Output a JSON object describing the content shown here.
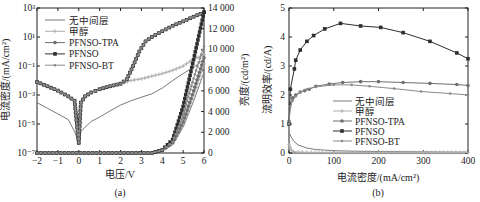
{
  "chart_data": [
    {
      "id": "a",
      "type": "line",
      "caption": "(a)",
      "xlabel": "电压/V",
      "ylabel": "电流密度/(mA/cm²)",
      "ylabel_right": "亮度/(cd/m²)",
      "xlim": [
        -2,
        6
      ],
      "ylim": [
        1e-07,
        1000.0
      ],
      "yscale": "log",
      "ylim_right": [
        0,
        14000
      ],
      "xticks": [
        -2,
        -1,
        0,
        1,
        2,
        3,
        4,
        5,
        6
      ],
      "yticks": [
        "10⁻⁷",
        "10⁻⁵",
        "10⁻³",
        "10⁻¹",
        "10¹",
        "10³"
      ],
      "yticks_right": [
        "0",
        "2 000",
        "4 000",
        "6 000",
        "8 000",
        "10 000",
        "12 000",
        "14 000"
      ],
      "legend": [
        "无中间层",
        "甲醇",
        "PFNSO-TPA",
        "PFNSO",
        "PFNSO-BT"
      ],
      "grid": false,
      "series_current_density": [
        {
          "name": "无中间层",
          "x": [
            -2,
            -1.5,
            -1,
            -0.5,
            -0.2,
            0,
            0.1,
            0.3,
            0.6,
            1,
            1.5,
            2,
            2.5,
            3,
            3.5,
            4,
            4.5,
            5,
            5.5,
            6
          ],
          "y": [
            0.0003,
            0.00012,
            5e-05,
            2e-05,
            3e-06,
            5e-07,
            3e-06,
            6e-06,
            1.5e-05,
            3e-05,
            8e-05,
            0.0002,
            0.0004,
            0.0007,
            0.0012,
            0.003,
            0.01,
            0.03,
            0.08,
            0.3
          ]
        },
        {
          "name": "甲醇",
          "x": [
            -2,
            -1.5,
            -1,
            -0.5,
            -0.2,
            0,
            0.1,
            0.3,
            0.6,
            1,
            1.5,
            2,
            2.5,
            3,
            3.5,
            4,
            4.5,
            5,
            5.5,
            6
          ],
          "y": [
            0.008,
            0.004,
            0.002,
            0.0008,
            0.0004,
            5e-07,
            0.0003,
            0.0008,
            0.0015,
            0.0025,
            0.004,
            0.006,
            0.01,
            0.013,
            0.02,
            0.03,
            0.05,
            0.1,
            0.3,
            0.6
          ]
        },
        {
          "name": "PFNSO-TPA",
          "x": [
            -2,
            -1.5,
            -1,
            -0.5,
            -0.2,
            0,
            0.1,
            0.3,
            0.6,
            1,
            1.5,
            2,
            2.3,
            2.6,
            2.9,
            3.2,
            3.5,
            4,
            4.5,
            5,
            5.5,
            6
          ],
          "y": [
            0.008,
            0.004,
            0.002,
            0.0008,
            0.0004,
            5e-07,
            0.0003,
            0.0008,
            0.0015,
            0.0025,
            0.004,
            0.006,
            0.012,
            0.1,
            1,
            5,
            10,
            25,
            60,
            120,
            250,
            500
          ]
        },
        {
          "name": "PFNSO",
          "x": [
            -2,
            -1.5,
            -1,
            -0.5,
            -0.2,
            0,
            0.1,
            0.3,
            0.6,
            1,
            1.5,
            2,
            2.3,
            2.6,
            2.9,
            3.2,
            3.5,
            4,
            4.5,
            5,
            5.5,
            6
          ],
          "y": [
            0.008,
            0.004,
            0.002,
            0.0008,
            0.0004,
            5e-07,
            0.0003,
            0.0008,
            0.0015,
            0.0025,
            0.004,
            0.006,
            0.012,
            0.1,
            1,
            5,
            10,
            25,
            60,
            120,
            250,
            500
          ]
        },
        {
          "name": "PFNSO-BT",
          "x": [
            -2,
            -1.5,
            -1,
            -0.5,
            -0.2,
            0,
            0.1,
            0.3,
            0.6,
            1,
            1.5,
            2,
            2.3,
            2.6,
            2.9,
            3.2,
            3.5,
            4,
            4.5,
            5,
            5.5,
            6
          ],
          "y": [
            0.008,
            0.004,
            0.002,
            0.0008,
            0.0004,
            5e-07,
            0.0003,
            0.0008,
            0.0015,
            0.0025,
            0.004,
            0.006,
            0.012,
            0.1,
            1,
            5,
            10,
            25,
            60,
            120,
            250,
            500
          ]
        }
      ],
      "series_luminance": [
        {
          "name": "无中间层",
          "x": [
            -2,
            3.5,
            4,
            4.5,
            5,
            5.5,
            6
          ],
          "y": [
            0,
            0,
            200,
            800,
            2500,
            5000,
            7800
          ]
        },
        {
          "name": "甲醇",
          "x": [
            -2,
            3.5,
            4,
            4.5,
            5,
            5.5,
            6
          ],
          "y": [
            0,
            0,
            200,
            900,
            2700,
            5600,
            8600
          ]
        },
        {
          "name": "PFNSO-TPA",
          "x": [
            -2,
            3.5,
            4,
            4.5,
            5,
            5.5,
            6
          ],
          "y": [
            0,
            0,
            250,
            1000,
            3000,
            6000,
            9200
          ]
        },
        {
          "name": "PFNSO",
          "x": [
            -2,
            3.5,
            4,
            4.5,
            5,
            5.5,
            6
          ],
          "y": [
            0,
            0,
            300,
            1300,
            4500,
            9000,
            13600
          ]
        },
        {
          "name": "PFNSO-BT",
          "x": [
            -2,
            3.5,
            4,
            4.5,
            5,
            5.5,
            6
          ],
          "y": [
            0,
            0,
            280,
            1100,
            3600,
            7200,
            10300
          ]
        }
      ]
    },
    {
      "id": "b",
      "type": "line",
      "caption": "(b)",
      "xlabel": "电流密度/(mA/cm²)",
      "ylabel": "流明效率/(cd/A)",
      "xlim": [
        0,
        400
      ],
      "ylim": [
        0,
        5
      ],
      "xticks": [
        0,
        100,
        200,
        300,
        400
      ],
      "yticks": [
        0,
        1,
        2,
        3,
        4,
        5
      ],
      "legend": [
        "无中间层",
        "甲醇",
        "PFNSO-TPA",
        "PFNSO",
        "PFNSO-BT"
      ],
      "grid": false,
      "series": [
        {
          "name": "无中间层",
          "x": [
            0,
            5,
            10,
            20,
            40,
            60,
            100,
            150,
            200,
            300,
            400
          ],
          "y": [
            0.7,
            0.55,
            0.42,
            0.28,
            0.17,
            0.12,
            0.08,
            0.06,
            0.05,
            0.04,
            0.03
          ]
        },
        {
          "name": "甲醇",
          "x": [
            0,
            5,
            10,
            20,
            50,
            100,
            200,
            300,
            400
          ],
          "y": [
            0.3,
            0.1,
            0.05,
            0.03,
            0.02,
            0.02,
            0.02,
            0.02,
            0.02
          ]
        },
        {
          "name": "PFNSO-TPA",
          "x": [
            0,
            3,
            8,
            15,
            25,
            35,
            45,
            60,
            90,
            120,
            160,
            200,
            255,
            315,
            375,
            400
          ],
          "y": [
            1.1,
            1.7,
            1.9,
            2.0,
            2.1,
            2.15,
            2.2,
            2.3,
            2.38,
            2.43,
            2.46,
            2.46,
            2.43,
            2.4,
            2.36,
            2.33
          ]
        },
        {
          "name": "PFNSO",
          "x": [
            0,
            3,
            12,
            15,
            25,
            40,
            55,
            80,
            115,
            160,
            205,
            255,
            315,
            375,
            400
          ],
          "y": [
            1.0,
            2.2,
            2.9,
            3.2,
            3.55,
            3.85,
            4.05,
            4.28,
            4.47,
            4.38,
            4.33,
            4.15,
            3.85,
            3.45,
            3.25
          ]
        },
        {
          "name": "PFNSO-BT",
          "x": [
            0,
            3,
            8,
            15,
            25,
            40,
            60,
            100,
            140,
            180,
            235,
            295,
            360,
            400
          ],
          "y": [
            1.0,
            1.6,
            1.8,
            1.95,
            2.1,
            2.2,
            2.28,
            2.35,
            2.35,
            2.3,
            2.22,
            2.12,
            2.05,
            2.0
          ]
        }
      ]
    }
  ],
  "captions": {
    "a": "(a)",
    "b": "(b)"
  }
}
